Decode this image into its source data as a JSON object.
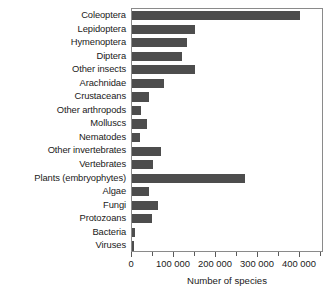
{
  "chart_data": {
    "type": "bar",
    "orientation": "horizontal",
    "title": "",
    "xlabel": "Number of species",
    "ylabel": "",
    "xlim": [
      0,
      457000
    ],
    "grid": false,
    "legend": null,
    "bar_color": "#4d4d4d",
    "xticks_major": [
      0,
      100000,
      200000,
      300000,
      400000
    ],
    "xtick_labels": [
      "0",
      "100 000",
      "200 000",
      "300 000",
      "400 000"
    ],
    "xticks_minor": [
      50000,
      150000,
      250000,
      350000,
      450000
    ],
    "categories": [
      "Coleoptera",
      "Lepidoptera",
      "Hymenoptera",
      "Diptera",
      "Other insects",
      "Arachnidae",
      "Crustaceans",
      "Other arthropods",
      "Molluscs",
      "Nematodes",
      "Other invertebrates",
      "Vertebrates",
      "Plants (embryophytes)",
      "Algae",
      "Fungi",
      "Protozoans",
      "Bacteria",
      "Viruses"
    ],
    "values": [
      400000,
      150000,
      130000,
      120000,
      150000,
      75000,
      40000,
      22000,
      35000,
      18000,
      68000,
      50000,
      270000,
      40000,
      62000,
      48000,
      7000,
      5000
    ]
  }
}
